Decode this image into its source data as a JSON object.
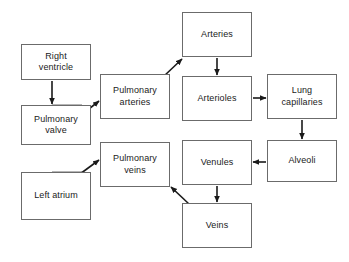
{
  "diagram": {
    "type": "flowchart",
    "background_color": "#ffffff",
    "box_border_color": "#6b6b6b",
    "text_color": "#1a1a1a",
    "arrow_color": "#1a1a1a",
    "nodes": [
      {
        "id": "right-ventricle",
        "label": "Right\nventricle",
        "x": 21,
        "y": 44,
        "w": 70,
        "h": 36
      },
      {
        "id": "pulmonary-valve",
        "label": "Pulmonary\nvalve",
        "x": 21,
        "y": 105,
        "w": 70,
        "h": 40
      },
      {
        "id": "left-atrium",
        "label": "Left atrium",
        "x": 21,
        "y": 172,
        "w": 70,
        "h": 48
      },
      {
        "id": "pulmonary-arteries",
        "label": "Pulmonary\narteries",
        "x": 100,
        "y": 74,
        "w": 70,
        "h": 45
      },
      {
        "id": "pulmonary-veins",
        "label": "Pulmonary\nveins",
        "x": 100,
        "y": 142,
        "w": 70,
        "h": 45
      },
      {
        "id": "arteries",
        "label": "Arteries",
        "x": 182,
        "y": 12,
        "w": 70,
        "h": 45
      },
      {
        "id": "arterioles",
        "label": "Arterioles",
        "x": 182,
        "y": 76,
        "w": 70,
        "h": 45
      },
      {
        "id": "venules",
        "label": "Venules",
        "x": 182,
        "y": 140,
        "w": 70,
        "h": 45
      },
      {
        "id": "veins",
        "label": "Veins",
        "x": 182,
        "y": 203,
        "w": 70,
        "h": 45
      },
      {
        "id": "lung-capillaries",
        "label": "Lung\ncapillaries",
        "x": 267,
        "y": 74,
        "w": 70,
        "h": 45
      },
      {
        "id": "alveoli",
        "label": "Alveoli",
        "x": 267,
        "y": 140,
        "w": 70,
        "h": 42
      }
    ],
    "edges": [
      {
        "id": "right-ventricle-to-pulmonary-valve",
        "from": "right-ventricle",
        "to": "pulmonary-valve",
        "direction": "down"
      },
      {
        "id": "pulmonary-valve-to-pulmonary-arteries",
        "from": "pulmonary-valve",
        "to": "pulmonary-arteries",
        "direction": "up-right"
      },
      {
        "id": "pulmonary-arteries-to-arteries",
        "from": "pulmonary-arteries",
        "to": "arteries",
        "direction": "up-right"
      },
      {
        "id": "arteries-to-arterioles",
        "from": "arteries",
        "to": "arterioles",
        "direction": "down"
      },
      {
        "id": "arterioles-to-lung-capillaries",
        "from": "arterioles",
        "to": "lung-capillaries",
        "direction": "right"
      },
      {
        "id": "lung-capillaries-to-alveoli",
        "from": "lung-capillaries",
        "to": "alveoli",
        "direction": "down"
      },
      {
        "id": "alveoli-to-venules",
        "from": "alveoli",
        "to": "venules",
        "direction": "left"
      },
      {
        "id": "venules-to-veins",
        "from": "venules",
        "to": "veins",
        "direction": "down"
      },
      {
        "id": "veins-to-pulmonary-veins",
        "from": "veins",
        "to": "pulmonary-veins",
        "direction": "up-left"
      },
      {
        "id": "left-atrium-to-pulmonary-veins",
        "from": "left-atrium",
        "to": "pulmonary-veins",
        "direction": "up-right"
      }
    ]
  }
}
